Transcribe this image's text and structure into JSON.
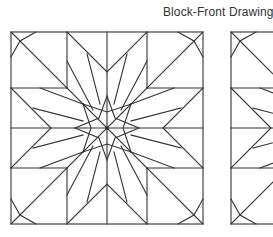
{
  "page": {
    "title": "Block-Front Drawings",
    "line_color": "#333333",
    "background": "#ffffff"
  },
  "blocks": [
    {
      "name": "block-front-drawing-1",
      "pattern": "eight-pointed star quilt block",
      "visible": "full"
    },
    {
      "name": "block-front-drawing-2",
      "pattern": "eight-pointed star quilt block",
      "visible": "partial (cropped on right)"
    }
  ]
}
